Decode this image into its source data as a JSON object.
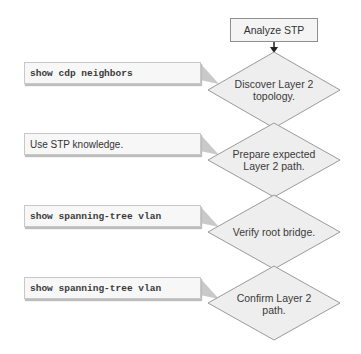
{
  "diagram": {
    "start": {
      "label": "Analyze STP"
    },
    "steps": [
      {
        "label": "Discover Layer 2 topology.",
        "callout": "show cdp neighbors",
        "callout_type": "command"
      },
      {
        "label": "Prepare expected Layer 2 path.",
        "callout": "Use STP knowledge.",
        "callout_type": "text"
      },
      {
        "label": "Verify root bridge.",
        "callout": "show spanning-tree vlan",
        "callout_type": "command"
      },
      {
        "label": "Confirm Layer 2 path.",
        "callout": "show spanning-tree vlan",
        "callout_type": "command"
      }
    ],
    "colors": {
      "diamond_fill": "#eeeeee",
      "diamond_stroke": "#9a9a9a",
      "callout_fill": "#f7f7f7",
      "pointer_fill": "#c8c8c8"
    }
  }
}
